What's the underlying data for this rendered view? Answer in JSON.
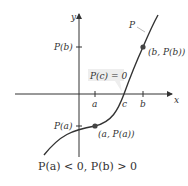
{
  "diagram": {
    "axes": {
      "x_label": "x",
      "y_label": "y"
    },
    "x_ticks": [
      "a",
      "c",
      "b"
    ],
    "y_ticks": [
      "P(b)",
      "P(a)"
    ],
    "curve_label": "P",
    "points": [
      {
        "label": "(a, P(a))"
      },
      {
        "label": "(b, P(b))"
      }
    ],
    "callout": "P(c) = 0",
    "caption": "P(a) < 0, P(b) > 0"
  }
}
